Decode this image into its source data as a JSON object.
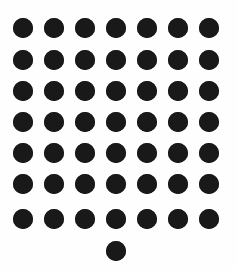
{
  "figure": {
    "name": "dot-grid-figure",
    "kind": "dot-matrix-pattern",
    "background_color": "#fefefe",
    "dot_color": "#191919",
    "canvas_width": 237,
    "canvas_height": 270,
    "dot_diameter": 20,
    "grid_rows": 7,
    "grid_columns": 7,
    "column_centers_x": [
      23,
      54,
      85,
      116,
      147,
      178,
      209
    ],
    "row_centers_y": [
      28,
      60,
      91,
      122,
      153,
      184,
      219
    ],
    "column_spacing": 31,
    "row_spacing": 31,
    "total_dots": 50,
    "extra_dot": {
      "label": "isolated-bottom-dot",
      "cx": 116,
      "cy": 251,
      "column_index": 4,
      "below_row_index": 7
    }
  },
  "chart_data": {
    "type": "scatter",
    "title": "",
    "xlabel": "",
    "ylabel": "",
    "grid": false,
    "legend": null,
    "xlim": [
      0,
      237
    ],
    "ylim": [
      270,
      0
    ],
    "marker": "circle",
    "marker_size": 20,
    "marker_color": "#191919",
    "points": [
      {
        "x": 23,
        "y": 28
      },
      {
        "x": 54,
        "y": 28
      },
      {
        "x": 85,
        "y": 28
      },
      {
        "x": 116,
        "y": 28
      },
      {
        "x": 147,
        "y": 28
      },
      {
        "x": 178,
        "y": 28
      },
      {
        "x": 209,
        "y": 28
      },
      {
        "x": 23,
        "y": 60
      },
      {
        "x": 54,
        "y": 60
      },
      {
        "x": 85,
        "y": 60
      },
      {
        "x": 116,
        "y": 60
      },
      {
        "x": 147,
        "y": 60
      },
      {
        "x": 178,
        "y": 60
      },
      {
        "x": 209,
        "y": 60
      },
      {
        "x": 23,
        "y": 91
      },
      {
        "x": 54,
        "y": 91
      },
      {
        "x": 85,
        "y": 91
      },
      {
        "x": 116,
        "y": 91
      },
      {
        "x": 147,
        "y": 91
      },
      {
        "x": 178,
        "y": 91
      },
      {
        "x": 209,
        "y": 91
      },
      {
        "x": 23,
        "y": 122
      },
      {
        "x": 54,
        "y": 122
      },
      {
        "x": 85,
        "y": 122
      },
      {
        "x": 116,
        "y": 122
      },
      {
        "x": 147,
        "y": 122
      },
      {
        "x": 178,
        "y": 122
      },
      {
        "x": 209,
        "y": 122
      },
      {
        "x": 23,
        "y": 153
      },
      {
        "x": 54,
        "y": 153
      },
      {
        "x": 85,
        "y": 153
      },
      {
        "x": 116,
        "y": 153
      },
      {
        "x": 147,
        "y": 153
      },
      {
        "x": 178,
        "y": 153
      },
      {
        "x": 209,
        "y": 153
      },
      {
        "x": 23,
        "y": 184
      },
      {
        "x": 54,
        "y": 184
      },
      {
        "x": 85,
        "y": 184
      },
      {
        "x": 116,
        "y": 184
      },
      {
        "x": 147,
        "y": 184
      },
      {
        "x": 178,
        "y": 184
      },
      {
        "x": 209,
        "y": 184
      },
      {
        "x": 23,
        "y": 219
      },
      {
        "x": 54,
        "y": 219
      },
      {
        "x": 85,
        "y": 219
      },
      {
        "x": 116,
        "y": 219
      },
      {
        "x": 147,
        "y": 219
      },
      {
        "x": 178,
        "y": 219
      },
      {
        "x": 209,
        "y": 219
      },
      {
        "x": 116,
        "y": 251
      }
    ]
  }
}
